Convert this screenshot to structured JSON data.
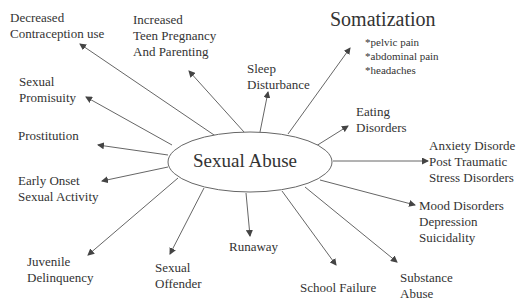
{
  "center": {
    "label": "Sexual Abuse"
  },
  "nodes": {
    "decreased_contraception": {
      "lines": [
        "Decreased",
        "Contraception use"
      ]
    },
    "teen_pregnancy": {
      "lines": [
        "Increased",
        "Teen Pregnancy",
        "And Parenting"
      ]
    },
    "sleep_disturbance": {
      "lines": [
        "Sleep",
        "Disturbance"
      ]
    },
    "somatization": {
      "title": "Somatization",
      "items": [
        "*pelvic pain",
        "*abdominal pain",
        "*headaches"
      ]
    },
    "eating_disorders": {
      "lines": [
        "Eating",
        "Disorders"
      ]
    },
    "anxiety_ptsd": {
      "lines": [
        "Anxiety Disorde",
        "Post Traumatic",
        "Stress Disorders"
      ]
    },
    "mood_disorders": {
      "lines": [
        "Mood Disorders",
        "Depression",
        "Suicidality"
      ]
    },
    "substance_abuse": {
      "lines": [
        "Substance",
        "Abuse"
      ]
    },
    "school_failure": {
      "lines": [
        "School Failure"
      ]
    },
    "runaway": {
      "lines": [
        "Runaway"
      ]
    },
    "sexual_offender": {
      "lines": [
        "Sexual",
        "Offender"
      ]
    },
    "juvenile_delinquency": {
      "lines": [
        "Juvenile",
        "Delinquency"
      ]
    },
    "early_onset": {
      "lines": [
        "Early Onset",
        "Sexual Activity"
      ]
    },
    "prostitution": {
      "lines": [
        "Prostitution"
      ]
    },
    "sexual_promiscuity": {
      "lines": [
        "Sexual",
        "Promisuity"
      ]
    }
  },
  "colors": {
    "line": "#555555",
    "text": "#333333",
    "background": "#ffffff"
  }
}
